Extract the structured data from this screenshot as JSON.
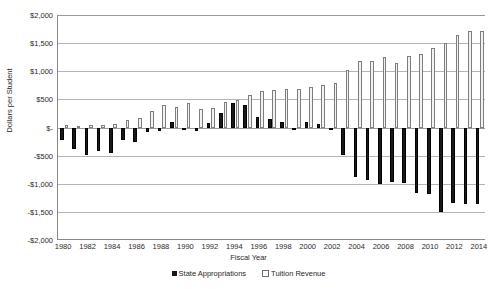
{
  "chart_data": {
    "type": "bar",
    "title": "",
    "xlabel": "Fiscal Year",
    "ylabel": "Dollars per Student",
    "ylim": [
      -2000,
      2000
    ],
    "ytick_values": [
      2000,
      1500,
      1000,
      500,
      0,
      -500,
      -1000,
      -1500,
      -2000
    ],
    "ytick_labels": [
      "$2,000",
      "$1,500",
      "$1,000",
      "$500",
      "$-",
      "-$500",
      "-$1,000",
      "-$1,500",
      "-$2,000"
    ],
    "grid": true,
    "legend_position": "bottom",
    "categories": [
      1980,
      1981,
      1982,
      1983,
      1984,
      1985,
      1986,
      1987,
      1988,
      1989,
      1990,
      1991,
      1992,
      1993,
      1994,
      1995,
      1996,
      1997,
      1998,
      1999,
      2000,
      2001,
      2002,
      2003,
      2004,
      2005,
      2006,
      2007,
      2008,
      2009,
      2010,
      2011,
      2012,
      2013,
      2014
    ],
    "xtick_labels": [
      "1980",
      "1982",
      "1984",
      "1986",
      "1988",
      "1990",
      "1992",
      "1994",
      "1996",
      "1998",
      "2000",
      "2002",
      "2004",
      "2006",
      "2008",
      "2010",
      "2012",
      "2014"
    ],
    "series": [
      {
        "name": "State Appropriations",
        "color": "#181818",
        "values": [
          -220,
          -390,
          -480,
          -410,
          -455,
          -225,
          -250,
          -80,
          -60,
          95,
          -15,
          -55,
          75,
          255,
          435,
          400,
          190,
          160,
          105,
          0,
          100,
          65,
          -30,
          -490,
          -880,
          -925,
          -1010,
          -975,
          -980,
          -1160,
          -1185,
          -1495,
          -1345,
          -1355,
          -1355
        ]
      },
      {
        "name": "Tuition Revenue",
        "color": "#f2f2f2",
        "values": [
          40,
          30,
          50,
          45,
          55,
          130,
          175,
          300,
          405,
          370,
          430,
          325,
          340,
          450,
          490,
          580,
          650,
          660,
          685,
          680,
          715,
          755,
          790,
          1020,
          1180,
          1185,
          1245,
          1145,
          1265,
          1300,
          1415,
          1500,
          1645,
          1715,
          1715
        ]
      }
    ],
    "bar_count": 35
  },
  "legend": {
    "items": [
      {
        "label": "State Appropriations",
        "swatch": "filled-square"
      },
      {
        "label": "Tuition Revenue",
        "swatch": "open-square"
      }
    ]
  },
  "icons": {
    "legend_filled_swatch": "filled-square-icon",
    "legend_open_swatch": "open-square-icon"
  }
}
